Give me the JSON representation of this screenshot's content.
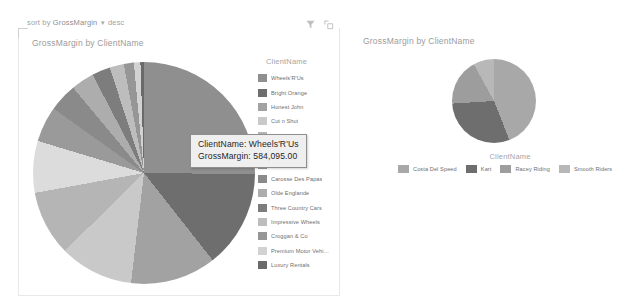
{
  "sort_bar": {
    "label": "sort by",
    "field": "GrossMargin",
    "arrow": "▾",
    "direction": "desc"
  },
  "toolbar": {
    "filter_icon": "filter-icon",
    "focus_icon": "focus-mode-icon"
  },
  "left_visual": {
    "title": "GrossMargin by ClientName",
    "legend_title": "ClientName"
  },
  "right_visual": {
    "title": "GrossMargin by ClientName",
    "legend_title": "ClientName"
  },
  "tooltip": {
    "line1": "ClientName: Wheels'R'Us",
    "line2": "GrossMargin: 584,095.00"
  },
  "chart_data": [
    {
      "type": "pie",
      "title": "GrossMargin by ClientName",
      "legend_title": "ClientName",
      "legend_position": "right",
      "value_field": "GrossMargin",
      "category_field": "ClientName",
      "sort": "GrossMargin desc",
      "categories": [
        "Wheels'R'Us",
        "Bright Orange",
        "Honest John",
        "Cut n Shut",
        "Aldo Motors",
        "Jungfrau",
        "Chateau Hip",
        "Carosse Des Papas",
        "Olde Englande",
        "Three Country Cars",
        "Impressive Wheels",
        "Croggan & Co",
        "Premium Motor Vehi…",
        "Luxury Rentals"
      ],
      "values": [
        584095.0,
        330000.0,
        290000.0,
        250000.0,
        220000.0,
        175000.0,
        120000.0,
        96000.0,
        78000.0,
        62000.0,
        48000.0,
        34000.0,
        22000.0,
        12000.0
      ],
      "colors": [
        "#8f8f8f",
        "#6e6e6e",
        "#a2a2a2",
        "#c9c9c9",
        "#b5b5b5",
        "#dcdcdc",
        "#9a9a9a",
        "#8a8a8a",
        "#adadad",
        "#7d7d7d",
        "#bdbdbd",
        "#969696",
        "#d2d2d2",
        "#6a6a6a"
      ],
      "highlighted": "Wheels'R'Us"
    },
    {
      "type": "pie",
      "title": "GrossMargin by ClientName",
      "legend_title": "ClientName",
      "legend_position": "bottom",
      "value_field": "GrossMargin",
      "category_field": "ClientName",
      "categories": [
        "Costa Del Speed",
        "Kart",
        "Racey Riding",
        "Smooth Riders"
      ],
      "values": [
        44,
        30,
        18,
        8
      ],
      "colors": [
        "#a8a8a8",
        "#6e6e6e",
        "#9d9d9d",
        "#b8b8b8"
      ]
    }
  ]
}
